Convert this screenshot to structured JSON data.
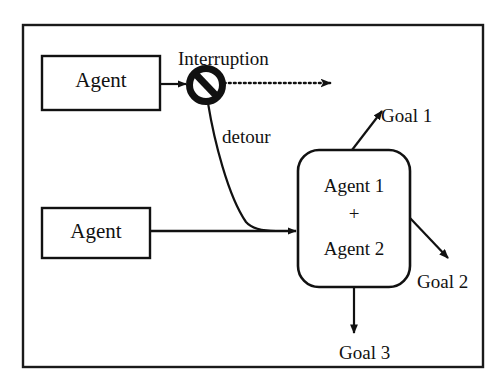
{
  "diagram": {
    "title_visible": false,
    "frame": {
      "name": "outer-frame",
      "stroke_color": "#1a1a1a"
    },
    "nodes": [
      {
        "id": "agent-top",
        "label": "Agent",
        "shape": "rectangle"
      },
      {
        "id": "agent-bottom",
        "label": "Agent",
        "shape": "rectangle"
      },
      {
        "id": "merged-agents",
        "shape": "rounded-rectangle",
        "line1": "Agent 1",
        "operator": "+",
        "line2": "Agent 2"
      }
    ],
    "annotations": {
      "interruption": "Interruption",
      "detour": "detour",
      "prohibition_icon": "no-entry-icon"
    },
    "goals": [
      {
        "id": "goal-1",
        "label": "Goal 1",
        "direction": "up-right"
      },
      {
        "id": "goal-2",
        "label": "Goal 2",
        "direction": "down-right"
      },
      {
        "id": "goal-3",
        "label": "Goal 3",
        "direction": "down"
      }
    ],
    "edges": [
      {
        "id": "agent-top-to-interruption",
        "style": "solid-arrow"
      },
      {
        "id": "interruption-blocked-path",
        "style": "dotted-arrow"
      },
      {
        "id": "detour-path",
        "style": "solid-curve"
      },
      {
        "id": "agent-bottom-to-merge",
        "style": "solid-arrow"
      }
    ],
    "colors": {
      "ink": "#111111",
      "background": "#ffffff"
    }
  }
}
